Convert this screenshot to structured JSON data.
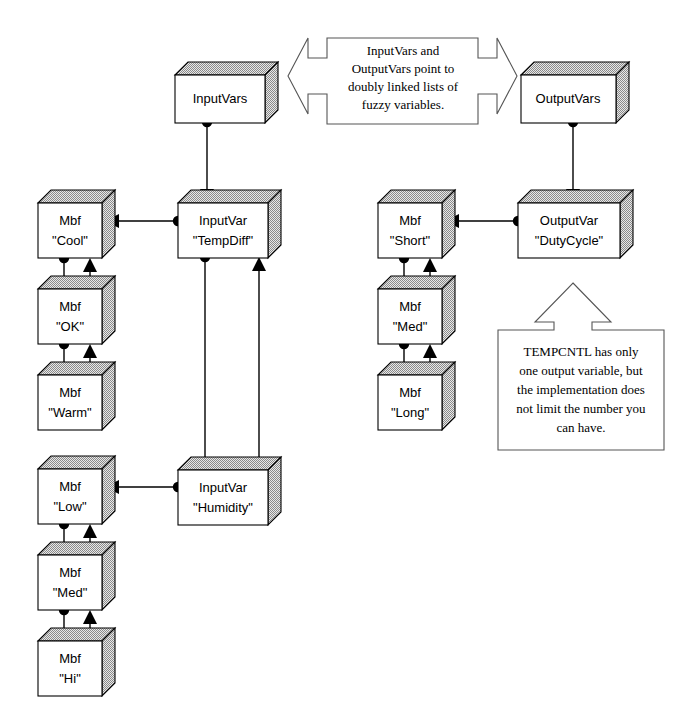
{
  "diagram": {
    "colors": {
      "background": "#ffffff",
      "box_front": "#ffffff",
      "box_shade": "#c8c8c8",
      "line": "#000000",
      "callout_border": "#555555"
    },
    "nodes": {
      "input_vars": {
        "label": "InputVars"
      },
      "output_vars": {
        "label": "OutputVars"
      },
      "input_var_tempdiff": {
        "label_line1": "InputVar",
        "label_line2": "\"TempDiff\""
      },
      "input_var_humidity": {
        "label_line1": "InputVar",
        "label_line2": "\"Humidity\""
      },
      "output_var_dutycycle": {
        "label_line1": "OutputVar",
        "label_line2": "\"DutyCycle\""
      },
      "mbf_cool": {
        "label_line1": "Mbf",
        "label_line2": "\"Cool\""
      },
      "mbf_ok": {
        "label_line1": "Mbf",
        "label_line2": "\"OK\""
      },
      "mbf_warm": {
        "label_line1": "Mbf",
        "label_line2": "\"Warm\""
      },
      "mbf_low": {
        "label_line1": "Mbf",
        "label_line2": "\"Low\""
      },
      "mbf_med_humidity": {
        "label_line1": "Mbf",
        "label_line2": "\"Med\""
      },
      "mbf_hi": {
        "label_line1": "Mbf",
        "label_line2": "\"Hi\""
      },
      "mbf_short": {
        "label_line1": "Mbf",
        "label_line2": "\"Short\""
      },
      "mbf_med_duty": {
        "label_line1": "Mbf",
        "label_line2": "\"Med\""
      },
      "mbf_long": {
        "label_line1": "Mbf",
        "label_line2": "\"Long\""
      }
    },
    "callouts": {
      "top": {
        "name": "double-arrow-callout",
        "lines": [
          "InputVars and",
          "OutputVars point to",
          "doubly linked lists of",
          "fuzzy variables."
        ]
      },
      "bottom_right": {
        "name": "up-arrow-callout",
        "lines": [
          "TEMPCNTL has only",
          "one output variable, but",
          "the implementation does",
          "not limit the number you",
          "can have."
        ]
      }
    }
  }
}
